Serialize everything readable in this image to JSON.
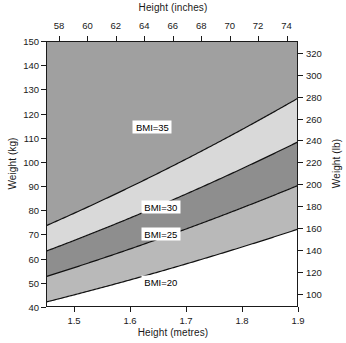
{
  "chart_data": {
    "type": "area",
    "title": "",
    "subtitle": "",
    "xlabel": "Height (metres)",
    "ylabel": "Weight (kg)",
    "xlabel_top": "Height (inches)",
    "ylabel_right": "Weight (lb)",
    "xlim": [
      1.45,
      1.9
    ],
    "ylim": [
      40,
      150
    ],
    "xlim_top_inches": [
      57.087,
      74.803
    ],
    "ylim_right_lb": [
      88.18,
      330.69
    ],
    "grid": false,
    "legend_position": "inline-labels",
    "x_ticks": [
      1.5,
      1.6,
      1.7,
      1.8,
      1.9
    ],
    "x_tick_labels": [
      "1.5",
      "1.6",
      "1.7",
      "1.8",
      "1.9"
    ],
    "x_ticks_top_inches": [
      58,
      60,
      62,
      64,
      66,
      68,
      70,
      72,
      74
    ],
    "x_tick_labels_top": [
      "58",
      "60",
      "62",
      "64",
      "66",
      "68",
      "70",
      "72",
      "74"
    ],
    "y_ticks": [
      40,
      50,
      60,
      70,
      80,
      90,
      100,
      110,
      120,
      130,
      140,
      150
    ],
    "y_tick_labels": [
      "40",
      "50",
      "60",
      "70",
      "80",
      "90",
      "100",
      "110",
      "120",
      "130",
      "140",
      "150"
    ],
    "y_ticks_right_lb": [
      100,
      120,
      140,
      160,
      180,
      200,
      220,
      240,
      260,
      280,
      300,
      320
    ],
    "y_tick_labels_right": [
      "100",
      "120",
      "140",
      "160",
      "180",
      "200",
      "220",
      "240",
      "260",
      "280",
      "300",
      "320"
    ],
    "series": [
      {
        "name": "BMI=20",
        "bmi": 20,
        "label": "BMI=20",
        "label_at": {
          "x": 1.655,
          "y": 50.5
        },
        "x": [
          1.45,
          1.5,
          1.55,
          1.6,
          1.65,
          1.7,
          1.75,
          1.8,
          1.85,
          1.9
        ],
        "values": [
          42.05,
          45.0,
          48.05,
          51.2,
          54.45,
          57.8,
          61.25,
          64.8,
          68.45,
          72.2
        ]
      },
      {
        "name": "BMI=25",
        "bmi": 25,
        "label": "BMI=25",
        "label_at": {
          "x": 1.655,
          "y": 70.0
        },
        "x": [
          1.45,
          1.5,
          1.55,
          1.6,
          1.65,
          1.7,
          1.75,
          1.8,
          1.85,
          1.9
        ],
        "values": [
          52.56,
          56.25,
          60.06,
          64.0,
          68.06,
          72.25,
          76.56,
          81.0,
          85.56,
          90.25
        ]
      },
      {
        "name": "BMI=30",
        "bmi": 30,
        "label": "BMI=30",
        "label_at": {
          "x": 1.655,
          "y": 81.5
        },
        "x": [
          1.45,
          1.5,
          1.55,
          1.6,
          1.65,
          1.7,
          1.75,
          1.8,
          1.85,
          1.9
        ],
        "values": [
          63.08,
          67.5,
          72.08,
          76.8,
          81.68,
          86.7,
          91.88,
          97.2,
          102.68,
          108.3
        ]
      },
      {
        "name": "BMI=35",
        "bmi": 35,
        "label": "BMI=35",
        "label_at": {
          "x": 1.64,
          "y": 114.5
        },
        "x": [
          1.45,
          1.5,
          1.55,
          1.6,
          1.65,
          1.7,
          1.75,
          1.8,
          1.85,
          1.9
        ],
        "values": [
          73.59,
          78.75,
          84.09,
          89.6,
          95.29,
          101.15,
          107.19,
          113.4,
          119.79,
          126.35
        ]
      }
    ],
    "bands": [
      {
        "name": "under-20",
        "range": "BMI < 20",
        "color": "#ffffff"
      },
      {
        "name": "20-25",
        "range": "BMI 20-25",
        "color": "#b9b9b9"
      },
      {
        "name": "25-30",
        "range": "BMI 25-30",
        "color": "#8e8e8e"
      },
      {
        "name": "30-35",
        "range": "BMI 30-35",
        "color": "#d9d9d9"
      },
      {
        "name": "over-35",
        "range": "BMI > 35",
        "color": "#a0a0a0"
      }
    ],
    "annotations": [
      "BMI=20",
      "BMI=25",
      "BMI=30",
      "BMI=35"
    ],
    "colors": {
      "axis": "#1a1a1a",
      "curve": "#111111",
      "background": "#ffffff"
    }
  }
}
